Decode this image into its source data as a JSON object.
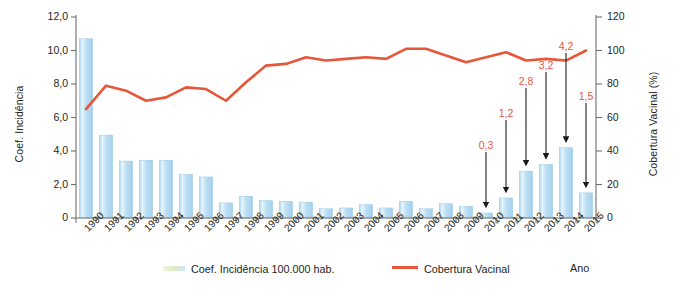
{
  "chart_data": {
    "type": "bar",
    "title": "",
    "subtitle": "",
    "xlabel": "Ano",
    "ylabel": "Coef. Incidência",
    "y2label": "Cobertura Vacinal (%)",
    "grid": false,
    "legend_position": "bottom",
    "ylim": [
      0,
      12
    ],
    "y2lim": [
      0,
      120
    ],
    "yticks": [
      "0",
      "2,0",
      "4,0",
      "6,0",
      "8,0",
      "10,0",
      "12,0"
    ],
    "ytick_values": [
      0,
      2,
      4,
      6,
      8,
      10,
      12
    ],
    "y2ticks": [
      "0",
      "20",
      "40",
      "60",
      "80",
      "100",
      "120"
    ],
    "y2tick_values": [
      0,
      20,
      40,
      60,
      80,
      100,
      120
    ],
    "categories": [
      "1990",
      "1991",
      "1992",
      "1993",
      "1994",
      "1995",
      "1996",
      "1997",
      "1998",
      "1999",
      "2000",
      "2001",
      "2002",
      "2003",
      "2004",
      "2005",
      "2006",
      "2007",
      "2008",
      "2009",
      "2010",
      "2011",
      "2012",
      "2013",
      "2014",
      "2015"
    ],
    "series": [
      {
        "name": "Coef. Incidência 100.000 hab.",
        "type": "bar",
        "axis": "left",
        "color": "#b9ddf1",
        "values": [
          10.7,
          4.95,
          3.4,
          3.45,
          3.45,
          2.6,
          2.45,
          0.9,
          1.3,
          1.05,
          1.0,
          0.95,
          0.55,
          0.6,
          0.8,
          0.6,
          1.0,
          0.55,
          0.85,
          0.7,
          0.3,
          1.2,
          2.8,
          3.2,
          4.2,
          1.5
        ]
      },
      {
        "name": "Cobertura Vacinal",
        "type": "line",
        "axis": "right",
        "color": "#e8563a",
        "values": [
          65,
          79,
          76,
          70,
          72,
          78,
          77,
          70,
          81,
          91,
          92,
          96,
          94,
          95,
          96,
          95,
          101,
          101,
          97,
          93,
          96,
          99,
          94,
          95,
          94,
          100
        ]
      }
    ],
    "annotations": [
      {
        "category": "2010",
        "label": "0,3",
        "value": 0.3
      },
      {
        "category": "2011",
        "label": "1,2",
        "value": 1.2
      },
      {
        "category": "2012",
        "label": "2,8",
        "value": 2.8
      },
      {
        "category": "2013",
        "label": "3,2",
        "value": 3.2
      },
      {
        "category": "2014",
        "label": "4,2",
        "value": 4.2
      },
      {
        "category": "2015",
        "label": "1,5",
        "value": 1.5
      }
    ],
    "legend": [
      {
        "label": "Coef. Incidência 100.000 hab.",
        "marker": "bar-swatch",
        "color": "#cfe6f5"
      },
      {
        "label": "Cobertura Vacinal",
        "marker": "line-swatch",
        "color": "#e8563a"
      }
    ],
    "axis_caption_right": "Ano",
    "colors": {
      "bar_fill": "#b9ddf1",
      "bar_highlight": "#e3f2fb",
      "line": "#e8563a",
      "axis": "#6d6e71",
      "annotation_text": "#e8563a",
      "text": "#231f20"
    }
  }
}
